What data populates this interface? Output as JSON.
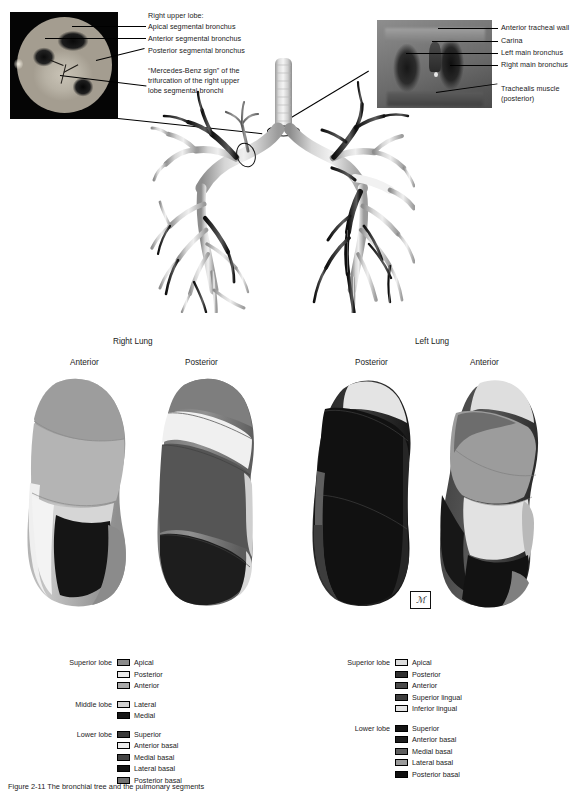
{
  "figure": {
    "insets": {
      "left": {
        "name": "bronchoscopic-view-right-upper-lobe",
        "labels": [
          "Right upper lobe:",
          "Apical segmental bronchus",
          "Anterior segmental bronchus",
          "Posterior segmental bronchus",
          "“Mercedes-Benz sign” of the",
          "trifurcation of the right upper",
          "lobe segmental bronchi"
        ]
      },
      "right": {
        "name": "bronchoscopic-view-carina",
        "labels": [
          "Anterior tracheal wall",
          "Carina",
          "Left main bronchus",
          "Right main bronchus",
          "Trachealis muscle",
          "(posterior)"
        ]
      }
    },
    "lung_views": {
      "right_lung_title": "Right Lung",
      "left_lung_title": "Left Lung",
      "right_views": [
        "Anterior",
        "Posterior"
      ],
      "left_views": [
        "Posterior",
        "Anterior"
      ]
    },
    "artist_mark": "ℳ"
  },
  "legend_right_lung": {
    "groups": [
      {
        "lobe": "Superior lobe",
        "items": [
          {
            "label": "Apical",
            "color": "#8a8a8a"
          },
          {
            "label": "Posterior",
            "color": "#e9e9e9"
          },
          {
            "label": "Anterior",
            "color": "#a9a9a9"
          }
        ]
      },
      {
        "lobe": "Middle lobe",
        "items": [
          {
            "label": "Lateral",
            "color": "#d2d2d2"
          },
          {
            "label": "Medial",
            "color": "#161616"
          }
        ]
      },
      {
        "lobe": "Lower lobe",
        "items": [
          {
            "label": "Superior",
            "color": "#3a3a3a"
          },
          {
            "label": "Anterior basal",
            "color": "#ececec"
          },
          {
            "label": "Medial basal",
            "color": "#434343"
          },
          {
            "label": "Lateral basal",
            "color": "#121212"
          },
          {
            "label": "Posterior basal",
            "color": "#707070"
          }
        ]
      }
    ]
  },
  "legend_left_lung": {
    "groups": [
      {
        "lobe": "Superior lobe",
        "items": [
          {
            "label": "Apical",
            "color": "#dcdcdc"
          },
          {
            "label": "Posterior",
            "color": "#303030"
          },
          {
            "label": "Anterior",
            "color": "#4a4a4a"
          },
          {
            "label": "Superior lingual",
            "color": "#3d3d3d"
          },
          {
            "label": "Inferior lingual",
            "color": "#e4e4e4"
          }
        ]
      },
      {
        "lobe": "Lower lobe",
        "items": [
          {
            "label": "Superior",
            "color": "#141414"
          },
          {
            "label": "Anterior basal",
            "color": "#1c1c1c"
          },
          {
            "label": "Medial basal",
            "color": "#5e5e5e"
          },
          {
            "label": "Lateral basal",
            "color": "#9a9a9a"
          },
          {
            "label": "Posterior basal",
            "color": "#0f0f0f"
          }
        ]
      }
    ]
  },
  "caption": {
    "text": "Figure 2-11  The bronchial tree and the pulmonary segments"
  }
}
